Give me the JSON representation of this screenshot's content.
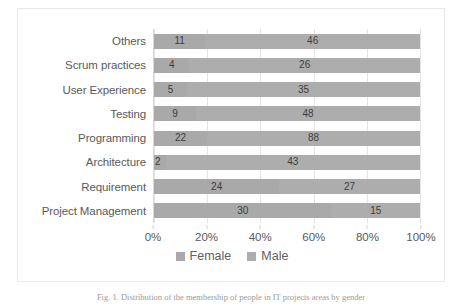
{
  "chart_data": {
    "type": "bar",
    "subtype": "100% stacked horizontal bar",
    "title": "",
    "xlabel": "",
    "ylabel": "",
    "grid": true,
    "legend_position": "bottom-center",
    "xlim": [
      0,
      100
    ],
    "x_tick_labels": [
      "0%",
      "20%",
      "40%",
      "60%",
      "80%",
      "100%"
    ],
    "x_tick_values": [
      0,
      20,
      40,
      60,
      80,
      100
    ],
    "categories": [
      "Others",
      "Scrum practices",
      "User Experience",
      "Testing",
      "Programming",
      "Architecture",
      "Requirement",
      "Project Management"
    ],
    "series": [
      {
        "name": "Female",
        "color": "#a9a9a9",
        "values": [
          11,
          4,
          5,
          9,
          22,
          2,
          24,
          30
        ]
      },
      {
        "name": "Male",
        "color": "#adadad",
        "values": [
          46,
          26,
          35,
          48,
          88,
          43,
          27,
          15
        ]
      }
    ],
    "rows": [
      {
        "category": "Others",
        "female": 11,
        "male": 46,
        "female_pct": 19.3,
        "male_pct": 80.7
      },
      {
        "category": "Scrum practices",
        "female": 4,
        "male": 26,
        "female_pct": 13.3,
        "male_pct": 86.7
      },
      {
        "category": "User Experience",
        "female": 5,
        "male": 35,
        "female_pct": 12.5,
        "male_pct": 87.5
      },
      {
        "category": "Testing",
        "female": 9,
        "male": 48,
        "female_pct": 15.8,
        "male_pct": 84.2
      },
      {
        "category": "Programming",
        "female": 22,
        "male": 88,
        "female_pct": 20.0,
        "male_pct": 80.0
      },
      {
        "category": "Architecture",
        "female": 2,
        "male": 43,
        "female_pct": 4.4,
        "male_pct": 95.6
      },
      {
        "category": "Requirement",
        "female": 24,
        "male": 27,
        "female_pct": 47.1,
        "male_pct": 52.9
      },
      {
        "category": "Project Management",
        "female": 30,
        "male": 15,
        "female_pct": 66.7,
        "male_pct": 33.3
      }
    ]
  },
  "legend": {
    "items": [
      {
        "label": "Female",
        "swatch": "female-legend-swatch"
      },
      {
        "label": "Male",
        "swatch": "male-legend-swatch"
      }
    ]
  },
  "caption": {
    "text": "Fig. 1.  Distribution of the membership of people in IT projects areas by gender"
  }
}
